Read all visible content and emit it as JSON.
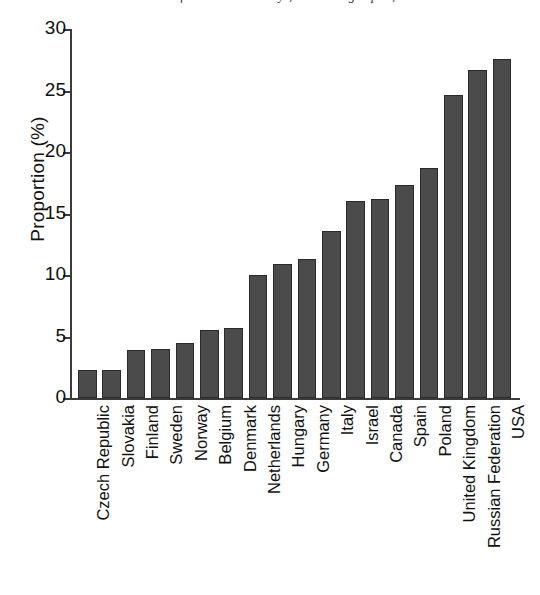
{
  "caption": {
    "text": "Source: data from national surveys, World Drug Report, 2005."
  },
  "axes": {
    "ylabel": "Proportion (%)",
    "yticks": [
      0,
      5,
      10,
      15,
      20,
      25,
      30
    ],
    "ytick_labels": [
      "0",
      "5",
      "10",
      "15",
      "20",
      "25",
      "30"
    ],
    "ymin": 0,
    "ymax": 30
  },
  "style": {
    "bar_fill": "#4b4b4b",
    "bar_edge": "#2a2a2a",
    "axis_color": "#3b3b3b",
    "background": "#ffffff"
  },
  "chart_data": {
    "type": "bar",
    "title": "",
    "xlabel": "",
    "ylabel": "Proportion (%)",
    "ylim": [
      0,
      30
    ],
    "grid": false,
    "legend": null,
    "categories": [
      "Czech Republic",
      "Slovakia",
      "Finland",
      "Sweden",
      "Norway",
      "Belgium",
      "Denmark",
      "Netherlands",
      "Hungary",
      "Germany",
      "Italy",
      "Israel",
      "Canada",
      "Spain",
      "Poland",
      "United Kingdom",
      "Russian Federation",
      "USA"
    ],
    "values": [
      2.3,
      2.3,
      3.9,
      4.0,
      4.5,
      5.5,
      5.7,
      10.0,
      10.9,
      11.3,
      13.6,
      16.0,
      16.2,
      17.3,
      18.7,
      24.6,
      26.7,
      27.6
    ]
  }
}
